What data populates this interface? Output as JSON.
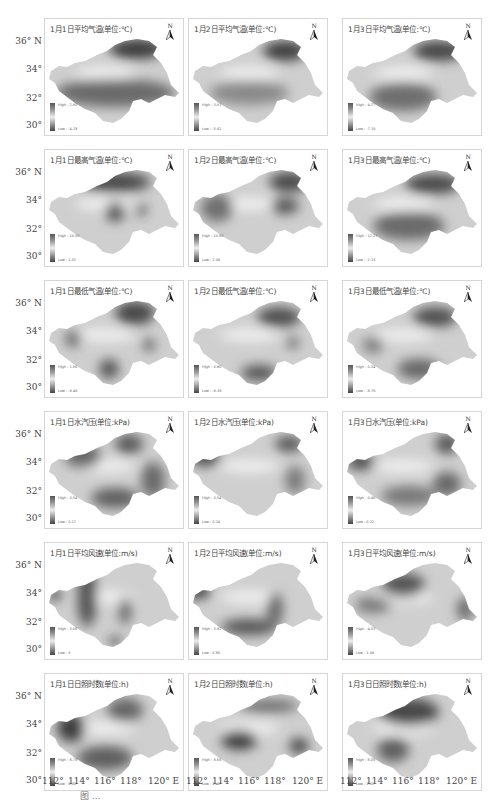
{
  "figure": {
    "caption": "图 ..."
  },
  "axes": {
    "lat_labels": [
      "36° N",
      "34°",
      "32°",
      "30°"
    ],
    "lon_labels": [
      "112°",
      "114°",
      "116°",
      "118°",
      "120° E"
    ]
  },
  "north_arrow": {
    "label": "N",
    "icon": "north-arrow-icon"
  },
  "rows": [
    {
      "variable": "平均气温",
      "unit": "(单位:℃)",
      "panels": [
        {
          "title": "1月1日平均气温(单位:℃)",
          "high": "High : 2.60",
          "low": "Low : -4.28"
        },
        {
          "title": "1月2日平均气温(单位:℃)",
          "high": "High : 3.63",
          "low": "Low : -5.61"
        },
        {
          "title": "1月3日平均气温(单位:℃)",
          "high": "High : 4.27",
          "low": "Low : -7.16"
        }
      ]
    },
    {
      "variable": "最高气温",
      "unit": "(单位:℃)",
      "panels": [
        {
          "title": "1月1日最高气温(单位:℃)",
          "high": "High : 10.56",
          "low": "Low : 1.51"
        },
        {
          "title": "1月2日最高气温(单位:℃)",
          "high": "High : 10.88",
          "low": "Low : 2.09"
        },
        {
          "title": "1月3日最高气温(单位:℃)",
          "high": "High : 12.27",
          "low": "Low : -2.15"
        }
      ]
    },
    {
      "variable": "最低气温",
      "unit": "(单位:℃)",
      "panels": [
        {
          "title": "1月1日最低气温(单位:℃)",
          "high": "High : 1.56",
          "low": "Low : -9.46"
        },
        {
          "title": "1月2日最低气温(单位:℃)",
          "high": "High : 0.90",
          "low": "Low : -9.30"
        },
        {
          "title": "1月3日最低气温(单位:℃)",
          "high": "High : 0.34",
          "low": "Low : -8.76"
        }
      ]
    },
    {
      "variable": "水汽压",
      "unit": "(单位:kPa)",
      "panels": [
        {
          "title": "1月1日水汽压(单位:kPa)",
          "high": "High : 0.54",
          "low": "Low : 0.17"
        },
        {
          "title": "1月2日水汽压(单位:kPa)",
          "high": "High : 0.54",
          "low": "Low : 0.24"
        },
        {
          "title": "1月3日水汽压(单位:kPa)",
          "high": "High : 0.46",
          "low": "Low : 0.22"
        }
      ]
    },
    {
      "variable": "平均风速",
      "unit": "(单位:m/s)",
      "panels": [
        {
          "title": "1月1日平均风速(单位:m/s)",
          "high": "High : 3.68",
          "low": "Low : 0"
        },
        {
          "title": "1月2日平均风速(单位:m/s)",
          "high": "High : 3.91",
          "low": "Low : 0.86"
        },
        {
          "title": "1月3日平均风速(单位:m/s)",
          "high": "High : 4.03",
          "low": "Low : 1.09"
        }
      ]
    },
    {
      "variable": "日照时数",
      "unit": "(单位:h)",
      "panels": [
        {
          "title": "1月1日日照时数(单位:h)",
          "high": "High : 8.78",
          "low": "Low : 0.20"
        },
        {
          "title": "1月2日日照时数(单位:h)",
          "high": "High : 8.56",
          "low": "Low : 1.46"
        },
        {
          "title": "1月3日日照时数(单位:h)",
          "high": "High : 8.05",
          "low": "Low : 2.51"
        }
      ]
    }
  ]
}
